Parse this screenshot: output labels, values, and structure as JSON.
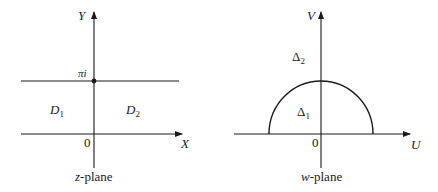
{
  "left_panel": {
    "plane_label_var": "z",
    "plane_label_rest": "-plane",
    "x_axis_label": "X",
    "y_axis_label": "Y",
    "origin_label": "0",
    "line_label": "πi",
    "region_left": {
      "base": "D",
      "sub": "1"
    },
    "region_right": {
      "base": "D",
      "sub": "2"
    }
  },
  "right_panel": {
    "plane_label_var": "w",
    "plane_label_rest": "-plane",
    "x_axis_label": "U",
    "y_axis_label": "V",
    "origin_label": "0",
    "region_outer": {
      "base": "Δ",
      "sub": "2"
    },
    "region_inner": {
      "base": "Δ",
      "sub": "1"
    }
  }
}
